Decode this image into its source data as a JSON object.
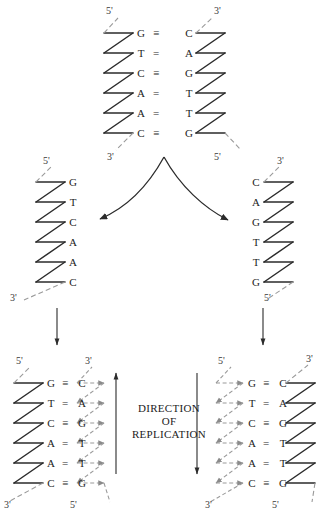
{
  "figure": {
    "title_text": "DIRECTION OF REPLICATION",
    "direction_label": {
      "line1": "DIRECTION",
      "line2": "OF",
      "line3": "REPLICATION"
    },
    "ink_color": "#1c1c1c",
    "parental_strand_color": "#2b2b2b",
    "new_strand_color": "#8a8a8a",
    "label_color": "#3a3a3a"
  },
  "prime_labels": {
    "five": "5'",
    "three": "3'"
  },
  "bonds": {
    "triple": "≡",
    "double": "="
  },
  "parent_duplex": {
    "name": "parental-dna-duplex",
    "left_top_label": "5'",
    "right_top_label": "3'",
    "left_bottom_label": "3'",
    "right_bottom_label": "5'",
    "pairs": [
      {
        "left": "G",
        "bond": "≡",
        "right": "C"
      },
      {
        "left": "T",
        "bond": "=",
        "right": "A"
      },
      {
        "left": "C",
        "bond": "≡",
        "right": "G"
      },
      {
        "left": "A",
        "bond": "=",
        "right": "T"
      },
      {
        "left": "A",
        "bond": "=",
        "right": "T"
      },
      {
        "left": "C",
        "bond": "≡",
        "right": "G"
      }
    ]
  },
  "left_template_strand": {
    "name": "left-template-strand",
    "top_label": "5'",
    "bottom_label": "3'",
    "bases": [
      "G",
      "T",
      "C",
      "A",
      "A",
      "C"
    ]
  },
  "right_template_strand": {
    "name": "right-template-strand",
    "top_label": "3'",
    "bottom_label": "5'",
    "bases": [
      "C",
      "A",
      "G",
      "T",
      "T",
      "G"
    ]
  },
  "left_daughter_duplex": {
    "name": "left-daughter-duplex",
    "left_top_label": "5'",
    "right_top_label": "3'",
    "left_bottom_label": "3'",
    "right_bottom_label": "5'",
    "left_strand_type": "parental",
    "right_strand_type": "newly-synthesized",
    "pairs": [
      {
        "left": "G",
        "bond": "≡",
        "right": "C"
      },
      {
        "left": "T",
        "bond": "=",
        "right": "A"
      },
      {
        "left": "C",
        "bond": "≡",
        "right": "G"
      },
      {
        "left": "A",
        "bond": "=",
        "right": "T"
      },
      {
        "left": "A",
        "bond": "=",
        "right": "T"
      },
      {
        "left": "C",
        "bond": "≡",
        "right": "G"
      }
    ]
  },
  "right_daughter_duplex": {
    "name": "right-daughter-duplex",
    "left_top_label": "5'",
    "right_top_label": "3'",
    "left_bottom_label": "3'",
    "right_bottom_label": "5'",
    "left_strand_type": "newly-synthesized",
    "right_strand_type": "parental",
    "pairs": [
      {
        "left": "G",
        "bond": "≡",
        "right": "C"
      },
      {
        "left": "T",
        "bond": "=",
        "right": "A"
      },
      {
        "left": "C",
        "bond": "≡",
        "right": "G"
      },
      {
        "left": "A",
        "bond": "=",
        "right": "T"
      },
      {
        "left": "A",
        "bond": "=",
        "right": "T"
      },
      {
        "left": "C",
        "bond": "≡",
        "right": "G"
      }
    ]
  },
  "arrows": {
    "separation_left": "curved-arrow-left",
    "separation_right": "curved-arrow-right",
    "left_down": "down-arrow-left",
    "right_down": "down-arrow-right",
    "direction_up": "up-arrow-direction",
    "direction_down": "down-arrow-direction"
  }
}
